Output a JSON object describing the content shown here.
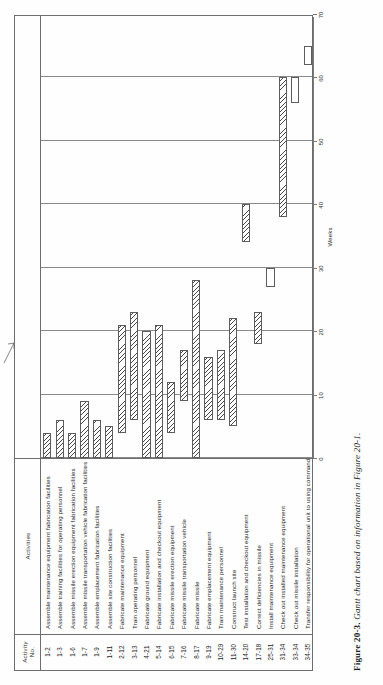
{
  "table": {
    "headers": {
      "activity_no": "Activity\nNo.",
      "activities": "Activities"
    },
    "rows": [
      {
        "no": "1-2",
        "activity": "Assemble maintenance equipment fabrication facilities",
        "start": 0,
        "end": 4
      },
      {
        "no": "1-3",
        "activity": "Assemble training facilities for operating personnel",
        "start": 0,
        "end": 6
      },
      {
        "no": "1-6",
        "activity": "Assemble missile erection equipment fabrication facilities",
        "start": 0,
        "end": 4
      },
      {
        "no": "1-7",
        "activity": "Assemble missile transportation vehicle fabrication facilities",
        "start": 0,
        "end": 9
      },
      {
        "no": "1-9",
        "activity": "Assemble emplacement fabrication facilities",
        "start": 0,
        "end": 6
      },
      {
        "no": "1-11",
        "activity": "Assemble site construction facilities",
        "start": 0,
        "end": 5
      },
      {
        "no": "2-12",
        "activity": "Fabricate maintenance equipment",
        "start": 4,
        "end": 21
      },
      {
        "no": "3-13",
        "activity": "Train operating personnel",
        "start": 6,
        "end": 23
      },
      {
        "no": "4-21",
        "activity": "Fabricate ground equipment",
        "start": 0,
        "end": 20
      },
      {
        "no": "5-14",
        "activity": "Fabricate installation and checkout equipment",
        "start": 0,
        "end": 21
      },
      {
        "no": "6-15",
        "activity": "Fabricate missile erection equipment",
        "start": 4,
        "end": 12
      },
      {
        "no": "7-16",
        "activity": "Fabricate missile transportation vehicle",
        "start": 9,
        "end": 17
      },
      {
        "no": "8-17",
        "activity": "Fabricate missile",
        "start": 0,
        "end": 28
      },
      {
        "no": "9-19",
        "activity": "Fabricate emplacement equipment",
        "start": 6,
        "end": 16
      },
      {
        "no": "10-29",
        "activity": "Train maintenance personnel",
        "start": 6,
        "end": 17
      },
      {
        "no": "11-30",
        "activity": "Construct launch site",
        "start": 5,
        "end": 22
      },
      {
        "no": "14-20",
        "activity": "Test installation and checkout equipment",
        "start": 34,
        "end": 40
      },
      {
        "no": "17-18",
        "activity": "Correct deficiencies in missile",
        "start": 18,
        "end": 23
      },
      {
        "no": "25-31",
        "activity": "Install maintenance equipment",
        "start": 27,
        "end": 30
      },
      {
        "no": "31-34",
        "activity": "Check out installed maintenance equipment",
        "start": 38,
        "end": 60
      },
      {
        "no": "33-34",
        "activity": "Check out missile installation",
        "start": 56,
        "end": 60
      },
      {
        "no": "34-35",
        "activity": "Transfer responsibility for operational unit to using command",
        "start": 62,
        "end": 65
      }
    ]
  },
  "chart_data": {
    "type": "bar",
    "orientation": "horizontal",
    "title": "",
    "xlabel": "Weeks",
    "ylabel": "",
    "xlim": [
      0,
      70
    ],
    "xticks": [
      0,
      10,
      20,
      30,
      40,
      50,
      60,
      70
    ],
    "xtick_labels": [
      "0",
      "10",
      "20",
      "30",
      "40",
      "50",
      "60",
      "70"
    ],
    "gridlines_at": [
      0,
      10,
      20,
      30,
      40,
      50,
      60
    ],
    "grid": true,
    "legend": "none",
    "categories": [
      "1-2",
      "1-3",
      "1-6",
      "1-7",
      "1-9",
      "1-11",
      "2-12",
      "3-13",
      "4-21",
      "5-14",
      "6-15",
      "7-16",
      "8-17",
      "9-19",
      "10-29",
      "11-30",
      "14-20",
      "17-18",
      "25-31",
      "31-34",
      "33-34",
      "34-35"
    ],
    "bars": [
      {
        "category": "1-2",
        "start": 0,
        "end": 4,
        "duration": 4
      },
      {
        "category": "1-3",
        "start": 0,
        "end": 6,
        "duration": 6
      },
      {
        "category": "1-6",
        "start": 0,
        "end": 4,
        "duration": 4
      },
      {
        "category": "1-7",
        "start": 0,
        "end": 9,
        "duration": 9
      },
      {
        "category": "1-9",
        "start": 0,
        "end": 6,
        "duration": 6
      },
      {
        "category": "1-11",
        "start": 0,
        "end": 5,
        "duration": 5
      },
      {
        "category": "2-12",
        "start": 4,
        "end": 21,
        "duration": 17
      },
      {
        "category": "3-13",
        "start": 6,
        "end": 23,
        "duration": 17
      },
      {
        "category": "4-21",
        "start": 0,
        "end": 20,
        "duration": 20
      },
      {
        "category": "5-14",
        "start": 0,
        "end": 21,
        "duration": 21
      },
      {
        "category": "6-15",
        "start": 4,
        "end": 12,
        "duration": 8
      },
      {
        "category": "7-16",
        "start": 9,
        "end": 17,
        "duration": 8
      },
      {
        "category": "8-17",
        "start": 0,
        "end": 28,
        "duration": 28
      },
      {
        "category": "9-19",
        "start": 6,
        "end": 16,
        "duration": 10
      },
      {
        "category": "10-29",
        "start": 6,
        "end": 17,
        "duration": 11
      },
      {
        "category": "11-30",
        "start": 5,
        "end": 22,
        "duration": 17
      },
      {
        "category": "14-20",
        "start": 34,
        "end": 40,
        "duration": 6
      },
      {
        "category": "17-18",
        "start": 18,
        "end": 23,
        "duration": 5
      },
      {
        "category": "25-31",
        "start": 27,
        "end": 30,
        "duration": 3
      },
      {
        "category": "31-34",
        "start": 38,
        "end": 60,
        "duration": 22
      },
      {
        "category": "33-34",
        "start": 56,
        "end": 60,
        "duration": 4
      },
      {
        "category": "34-35",
        "start": 62,
        "end": 65,
        "duration": 3
      }
    ]
  },
  "caption": {
    "figure_label": "Figure 20-3.",
    "title": "Gantt chart based on information in Figure 20-1."
  }
}
